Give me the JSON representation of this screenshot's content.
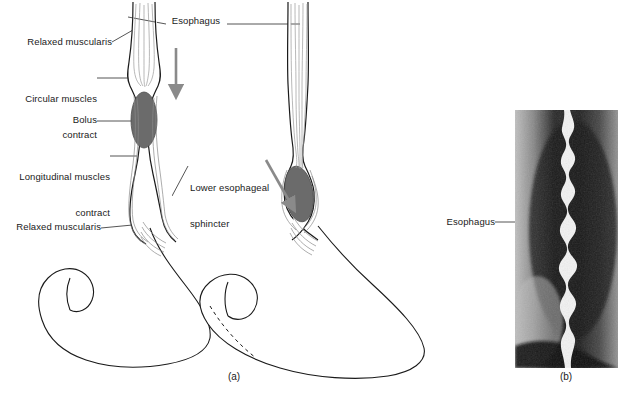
{
  "figure": {
    "background_color": "#ffffff",
    "ink_color": "#1a1a1a",
    "bolus_color": "#6b6b6b",
    "arrow_color": "#8a8a8a",
    "width": 632,
    "height": 401
  },
  "panels": [
    {
      "id": "a",
      "label": "(a)",
      "type": "line-diagram",
      "caption_x": 234,
      "caption_y": 377
    },
    {
      "id": "b",
      "label": "(b)",
      "type": "radiograph",
      "caption_x": 566,
      "caption_y": 377
    }
  ],
  "panel_a": {
    "labels": [
      {
        "key": "esophagus",
        "text": "Esophagus",
        "align": "center",
        "x": 196,
        "y": 21,
        "lines": [
          "Esophagus"
        ]
      },
      {
        "key": "relaxed_top",
        "text": "Relaxed muscularis",
        "align": "right",
        "x": 10,
        "y": 39,
        "lines": [
          "Relaxed muscularis"
        ]
      },
      {
        "key": "circular",
        "text": "Circular muscles contract",
        "align": "right",
        "x": 10,
        "y": 72,
        "lines": [
          "Circular muscles",
          "contract"
        ]
      },
      {
        "key": "bolus",
        "text": "Bolus",
        "align": "right",
        "x": 10,
        "y": 117,
        "lines": [
          "Bolus"
        ]
      },
      {
        "key": "longitudinal",
        "text": "Longitudinal muscles contract",
        "align": "right",
        "x": 10,
        "y": 150,
        "lines": [
          "Longitudinal muscles",
          "contract"
        ]
      },
      {
        "key": "les",
        "text": "Lower esophageal sphincter",
        "align": "left",
        "x": 190,
        "y": 161,
        "lines": [
          "Lower esophageal",
          "sphincter"
        ]
      },
      {
        "key": "relaxed_bottom",
        "text": "Relaxed muscularis",
        "align": "right",
        "x": 10,
        "y": 224,
        "lines": [
          "Relaxed muscularis"
        ]
      }
    ],
    "stages": [
      {
        "name": "stage-1-upper-bolus",
        "bolus_position": "upper-esophagus",
        "arrow": "vertical-down"
      },
      {
        "name": "stage-2-lower-bolus",
        "bolus_position": "lower-esophageal-sphincter",
        "arrow": "diagonal-down-left"
      }
    ]
  },
  "panel_b": {
    "labels": [
      {
        "key": "esophagus",
        "text": "Esophagus",
        "align": "right",
        "x": 446,
        "y": 217,
        "lines": [
          "Esophagus"
        ]
      }
    ],
    "image": {
      "name": "barium-swallow-radiograph",
      "description": "Barium swallow radiograph showing wavy contrast-filled esophageal lumen",
      "x": 515,
      "y": 110,
      "width": 103,
      "height": 258
    }
  }
}
